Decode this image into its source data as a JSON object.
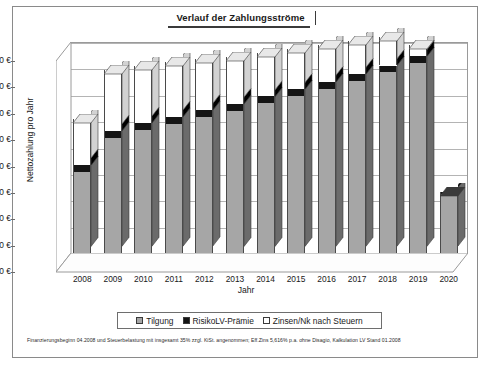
{
  "chart_data": {
    "type": "bar",
    "stacked": true,
    "projection": "3d",
    "title": "Verlauf der Zahlungsströme",
    "xlabel": "Jahr",
    "ylabel": "Nettozahlung pro Jahr",
    "categories": [
      "2008",
      "2009",
      "2010",
      "2011",
      "2012",
      "2013",
      "2014",
      "2015",
      "2016",
      "2017",
      "2018",
      "2019",
      "2020"
    ],
    "ylim": [
      0,
      16000
    ],
    "ytick_values": [
      0,
      2000,
      4000,
      6000,
      8000,
      10000,
      12000,
      14000,
      16000
    ],
    "ytick_labels": [
      "0 €",
      "2000 €",
      "4000 €",
      "6000 €",
      "8000 €",
      "10 000 €",
      "12 000 €",
      "14 000 €",
      "16 000 €"
    ],
    "grid": true,
    "legend_position": "bottom",
    "series": [
      {
        "name": "Tilgung",
        "color": "#a6a6a6",
        "values": [
          6150,
          8750,
          9350,
          9800,
          10300,
          10800,
          11350,
          11900,
          12450,
          13050,
          13700,
          14400,
          4450
        ]
      },
      {
        "name": "RisikoLV-Prämie",
        "color": "#151515",
        "values": [
          560,
          520,
          520,
          520,
          520,
          520,
          520,
          520,
          520,
          520,
          520,
          520,
          180
        ]
      },
      {
        "name": "Zinsen/Nk nach Steuern",
        "color": "#ffffff",
        "values": [
          3490,
          4630,
          4330,
          4180,
          3880,
          3580,
          3330,
          3080,
          2830,
          2530,
          2180,
          880,
          0
        ]
      }
    ],
    "totals": [
      10200,
      13900,
      14200,
      14500,
      14700,
      14900,
      15200,
      15500,
      15800,
      16100,
      16400,
      15800,
      4630
    ],
    "footnote": "Finanzierungsbeginn 04.2008 und Steuerbelastung mit insgesamt 35% zzgl. KiSt. angenommen; Eff.Zins 5,616% p.a. ohne Disagio, Kalkulation LV Stand 01.2008"
  }
}
